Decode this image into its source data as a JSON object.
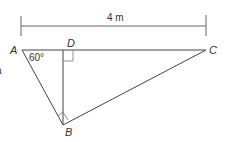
{
  "diagram": {
    "dimension_label": "4 m",
    "vertices": {
      "A": "A",
      "B": "B",
      "C": "C",
      "D": "D"
    },
    "angle_label": "60°",
    "right_angles": [
      "D",
      "B"
    ],
    "partial_text_left": "a"
  }
}
